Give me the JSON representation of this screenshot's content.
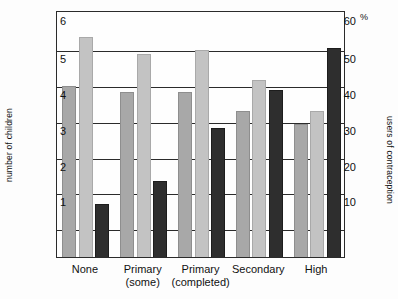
{
  "chart_data": {
    "type": "bar",
    "title": "",
    "categories": [
      "None",
      "Primary (some)",
      "Primary (completed)",
      "Secondary",
      "High"
    ],
    "category_lines": [
      [
        "None",
        ""
      ],
      [
        "Primary",
        "(some)"
      ],
      [
        "Primary",
        "(completed)"
      ],
      [
        "Secondary",
        ""
      ],
      [
        "High",
        ""
      ]
    ],
    "series": [
      {
        "name": "number of children (series 1)",
        "axis": "left",
        "color": "#a8a8a8",
        "values": [
          4.5,
          4.35,
          4.35,
          3.85,
          3.5
        ]
      },
      {
        "name": "number of children (series 2)",
        "axis": "left",
        "color": "#c3c3c3",
        "values": [
          5.8,
          5.35,
          5.45,
          4.65,
          3.85
        ]
      },
      {
        "name": "users of contraception (%)",
        "axis": "right",
        "color": "#2e2e2e",
        "values": [
          14,
          20,
          34,
          44,
          55
        ]
      }
    ],
    "left_axis": {
      "label": "number of children",
      "ticks": [
        6,
        5,
        4,
        3,
        2,
        1
      ],
      "min": 0,
      "max": 6.5
    },
    "right_axis": {
      "label": "users of contraception",
      "unit": "%",
      "ticks": [
        60,
        50,
        40,
        30,
        20,
        10
      ],
      "min": 0,
      "max": 65
    },
    "gridlines": true,
    "legend": "none",
    "xlabel": "",
    "ylabel": "number of children"
  },
  "axes": {
    "left_title": "number of children",
    "right_title": "users of contraception",
    "percent_symbol": "%",
    "left_ticks": [
      "6",
      "5",
      "4",
      "3",
      "2",
      "1"
    ],
    "right_ticks": [
      "60",
      "50",
      "40",
      "30",
      "20",
      "10"
    ]
  },
  "categories": [
    {
      "line1": "None",
      "line2": ""
    },
    {
      "line1": "Primary",
      "line2": "(some)"
    },
    {
      "line1": "Primary",
      "line2": "(completed)"
    },
    {
      "line1": "Secondary",
      "line2": ""
    },
    {
      "line1": "High",
      "line2": ""
    }
  ]
}
